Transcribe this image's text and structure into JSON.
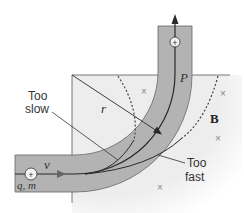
{
  "figure": {
    "labels": {
      "too_slow_line1": "Too",
      "too_slow_line2": "slow",
      "too_fast_line1": "Too",
      "too_fast_line2": "fast",
      "radius": "r",
      "point": "P",
      "field": "B",
      "velocity": "v",
      "charge_mass": "q, m",
      "charge_sign": "+"
    },
    "field_markers": "×",
    "colors": {
      "tube_fill": "#b3b3b3",
      "field_fill": "#eeeeee",
      "line": "#2a2a2a",
      "velocity_arrow": "#555555"
    }
  }
}
